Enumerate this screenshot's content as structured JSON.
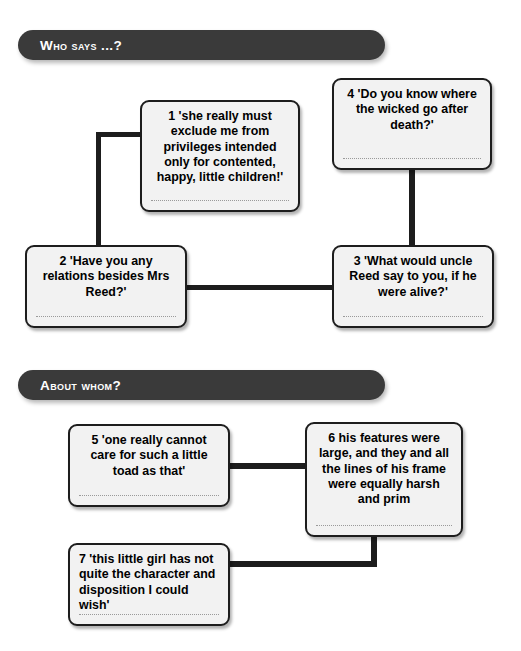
{
  "sections": [
    {
      "id": "who-says",
      "title": "Who says ...?"
    },
    {
      "id": "about-whom",
      "title": "About whom?"
    }
  ],
  "boxes": [
    {
      "number": "1",
      "text": "'she really must exclude me from privileges intended only for contented, happy, little children!'",
      "section": "who-says"
    },
    {
      "number": "2",
      "text": "'Have you any relations besides Mrs Reed?'",
      "section": "who-says"
    },
    {
      "number": "3",
      "text": "'What would uncle Reed say to you, if he were alive?'",
      "section": "who-says"
    },
    {
      "number": "4",
      "text": "'Do you know where the wicked go after death?'",
      "section": "who-says"
    },
    {
      "number": "5",
      "text": "'one really cannot care for such a little toad as that'",
      "section": "about-whom"
    },
    {
      "number": "6",
      "text": "his features were large, and they and all the lines of his frame were equally harsh and prim",
      "section": "about-whom"
    },
    {
      "number": "7",
      "text": "'this little girl has not quite the character and disposition I could wish'",
      "section": "about-whom"
    }
  ],
  "colors": {
    "header_bar": "#3a3a3a",
    "header_text": "#ffffff",
    "box_fill": "#f2f2f2",
    "box_border": "#1d1d1d",
    "connector": "#1d1d1d",
    "answer_line": "#9a9a9a",
    "page_background": "#ffffff"
  }
}
